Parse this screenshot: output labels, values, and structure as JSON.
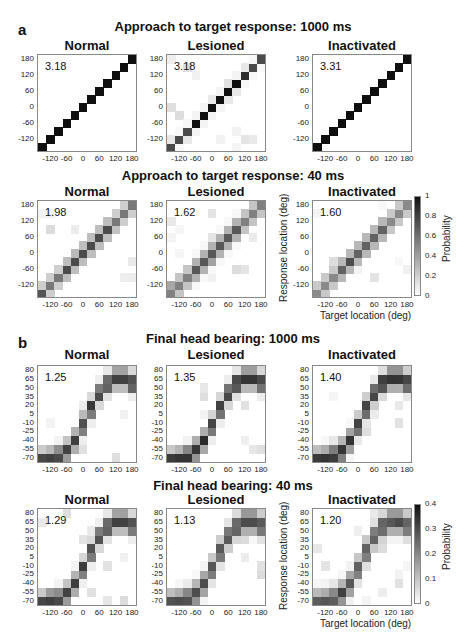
{
  "figure": {
    "panel_a_letter": "a",
    "panel_b_letter": "b",
    "rows": [
      {
        "title": "Approach to target response: 1000 ms"
      },
      {
        "title": "Approach to target response: 40 ms"
      },
      {
        "title": "Final head bearing: 1000 ms"
      },
      {
        "title": "Final head bearing: 40 ms"
      }
    ],
    "conditions": [
      "Normal",
      "Lesioned",
      "Inactivated"
    ],
    "axis": {
      "xlabel": "Target location (deg)",
      "ylabel": "Response location (deg)",
      "x_ticks": [
        "-120",
        "-60",
        "0",
        "60",
        "120",
        "180"
      ],
      "y_ticks_approach": [
        "180",
        "120",
        "60",
        "0",
        "-60",
        "-120"
      ],
      "y_ticks_head": [
        "80",
        "65",
        "50",
        "35",
        "20",
        "5",
        "-10",
        "-25",
        "-40",
        "-55",
        "-70"
      ]
    },
    "colorbar_a": {
      "label": "Probability",
      "ticks": [
        "1",
        "0.8",
        "0.6",
        "0.4",
        "0.2",
        "0"
      ]
    },
    "colorbar_b": {
      "label": "Probability",
      "ticks": [
        "0.4",
        "0.3",
        "0.2",
        "0.1",
        "0"
      ]
    }
  },
  "chart_data": [
    {
      "type": "heatmap",
      "title": "Approach to target response: 1000 ms — Normal",
      "stat": "3.18",
      "xlabel": "Target location (deg)",
      "ylabel": "Response location (deg)",
      "x_range": [
        -165,
        180
      ],
      "y_range": [
        -165,
        180
      ],
      "grid": "12x12",
      "pattern": "sharp diagonal, p≈1"
    },
    {
      "type": "heatmap",
      "title": "Approach to target response: 1000 ms — Lesioned",
      "stat": "3.18",
      "grid": "12x12",
      "pattern": "sharp diagonal, p≈1, faint spillover near -60 and 60"
    },
    {
      "type": "heatmap",
      "title": "Approach to target response: 1000 ms — Inactivated",
      "stat": "3.31",
      "grid": "12x12",
      "pattern": "sharp diagonal, p≈1"
    },
    {
      "type": "heatmap",
      "title": "Approach to target response: 40 ms — Normal",
      "stat": "1.98",
      "grid": "12x12",
      "pattern": "diagonal, peak ~0.9 near 0, blurred at periphery",
      "colorbar": [
        0,
        1
      ]
    },
    {
      "type": "heatmap",
      "title": "Approach to target response: 40 ms — Lesioned",
      "stat": "1.62",
      "grid": "12x12",
      "pattern": "diagonal, spread toward -120 for left targets",
      "colorbar": [
        0,
        1
      ]
    },
    {
      "type": "heatmap",
      "title": "Approach to target response: 40 ms — Inactivated",
      "stat": "1.60",
      "grid": "12x12",
      "pattern": "diagonal, blurred",
      "colorbar": [
        0,
        1
      ]
    },
    {
      "type": "heatmap",
      "title": "Final head bearing: 1000 ms — Normal",
      "stat": "1.25",
      "grid": "12x11",
      "pattern": "sigmoid from -55 to 70",
      "colorbar": [
        0,
        0.4
      ]
    },
    {
      "type": "heatmap",
      "title": "Final head bearing: 1000 ms — Lesioned",
      "stat": "1.35",
      "grid": "12x11",
      "pattern": "sigmoid from -55 to 70"
    },
    {
      "type": "heatmap",
      "title": "Final head bearing: 1000 ms — Inactivated",
      "stat": "1.40",
      "grid": "12x11",
      "pattern": "sigmoid, scattered outliers at 180"
    },
    {
      "type": "heatmap",
      "title": "Final head bearing: 40 ms — Normal",
      "stat": "1.29",
      "grid": "12x11",
      "pattern": "sigmoid"
    },
    {
      "type": "heatmap",
      "title": "Final head bearing: 40 ms — Lesioned",
      "stat": "1.13",
      "grid": "12x11",
      "pattern": "sigmoid, more spread"
    },
    {
      "type": "heatmap",
      "title": "Final head bearing: 40 ms — Inactivated",
      "stat": "1.20",
      "grid": "12x11",
      "pattern": "sigmoid, broad spread",
      "colorbar": [
        0,
        0.4
      ]
    }
  ],
  "plots": [
    {
      "stat": "3.18",
      "kind": "a",
      "peak": 1.0,
      "spread": 0.0
    },
    {
      "stat": "3.18",
      "kind": "a",
      "peak": 1.0,
      "spread": 0.05
    },
    {
      "stat": "3.31",
      "kind": "a",
      "peak": 1.0,
      "spread": 0.0
    },
    {
      "stat": "1.98",
      "kind": "a",
      "peak": 0.75,
      "spread": 0.35
    },
    {
      "stat": "1.62",
      "kind": "a",
      "peak": 0.7,
      "spread": 0.45
    },
    {
      "stat": "1.60",
      "kind": "a",
      "peak": 0.65,
      "spread": 0.45
    },
    {
      "stat": "1.25",
      "kind": "b",
      "peak": 0.8,
      "spread": 0.4
    },
    {
      "stat": "1.35",
      "kind": "b",
      "peak": 0.85,
      "spread": 0.4
    },
    {
      "stat": "1.40",
      "kind": "b",
      "peak": 0.85,
      "spread": 0.45
    },
    {
      "stat": "1.29",
      "kind": "b",
      "peak": 0.8,
      "spread": 0.4
    },
    {
      "stat": "1.13",
      "kind": "b",
      "peak": 0.75,
      "spread": 0.5
    },
    {
      "stat": "1.20",
      "kind": "b",
      "peak": 0.7,
      "spread": 0.55
    }
  ]
}
